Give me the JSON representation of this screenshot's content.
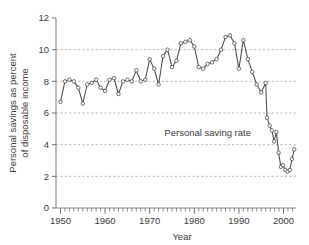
{
  "chart_data": {
    "type": "line",
    "title": "",
    "subtitle": "",
    "xlabel": "Year",
    "ylabel_line1": "Personal savings as percent",
    "ylabel_line2": "of disposable income",
    "xlim": [
      1949.0,
      2002.8
    ],
    "ylim": [
      0,
      12
    ],
    "xticks": [
      1950,
      1960,
      1970,
      1980,
      1990,
      2000
    ],
    "xticklabels": [
      "1950",
      "1960",
      "1970",
      "1980",
      "1990",
      "2000"
    ],
    "yticks": [
      0,
      2,
      4,
      6,
      8,
      10,
      12
    ],
    "yticklabels": [
      "0",
      "2",
      "4",
      "6",
      "8",
      "10",
      "12"
    ],
    "minor_xtick_interval": 1,
    "grid": "horizontal-dashed",
    "grid_values": [
      2,
      4,
      6,
      8,
      10
    ],
    "legend": "none",
    "annotations": [
      {
        "text": "Personal saving rate",
        "x": 1983.0,
        "y": 4.55
      }
    ],
    "series": [
      {
        "name": "Personal saving rate",
        "marker": "open-circle",
        "color": "#4a4a4a",
        "x": [
          1950,
          1951,
          1952,
          1953,
          1954,
          1955,
          1956,
          1957,
          1958,
          1959,
          1960,
          1961,
          1962,
          1963,
          1964,
          1965,
          1966,
          1967,
          1968,
          1969,
          1970,
          1971,
          1972,
          1973,
          1974,
          1975,
          1976,
          1977,
          1978,
          1979,
          1980,
          1981,
          1982,
          1983,
          1984,
          1985,
          1986,
          1987,
          1988,
          1989,
          1990,
          1991,
          1992,
          1993,
          1994,
          1995,
          1996,
          1997,
          1998,
          1999,
          2000,
          2001,
          2002
        ],
        "values": [
          6.7,
          8.0,
          8.1,
          8.0,
          7.6,
          6.6,
          7.8,
          7.9,
          8.1,
          7.6,
          7.4,
          8.1,
          8.2,
          7.2,
          8.0,
          8.1,
          8.0,
          8.7,
          8.0,
          8.1,
          9.4,
          8.8,
          7.8,
          9.6,
          10.0,
          8.9,
          9.3,
          10.4,
          10.5,
          10.6,
          10.2,
          8.9,
          8.8,
          9.1,
          9.2,
          9.4,
          10.0,
          10.8,
          10.9,
          10.4,
          8.8,
          10.6,
          9.4,
          8.6,
          7.8,
          7.3,
          7.9,
          7.8,
          7.5,
          8.1,
          8.6,
          7.0,
          6.2
        ]
      }
    ],
    "series_tail": {
      "name": "Personal saving rate (continued quarterly/late)",
      "x": [
        1996.3,
        1996.9,
        1997.4,
        1997.9,
        1998.4,
        1998.9,
        1999.4,
        1999.9,
        2000.4,
        2000.9,
        2001.4,
        2001.9,
        2002.4
      ],
      "values": [
        5.7,
        5.2,
        4.9,
        4.2,
        4.8,
        3.5,
        2.6,
        2.7,
        2.4,
        2.3,
        2.4,
        3.1,
        3.7
      ]
    }
  },
  "axis": {
    "x_axis_name": "year-axis",
    "y_axis_name": "percent-axis"
  }
}
